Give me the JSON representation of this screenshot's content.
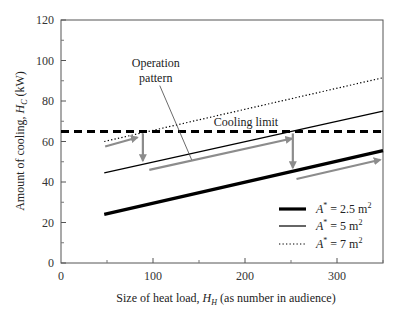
{
  "chart_data": {
    "type": "line",
    "title": "",
    "xlabel": "Size of heat load, H_H (as number in audience)",
    "xlabel_parts": {
      "prefix": "Size of heat load, ",
      "symbol": "H",
      "sub": "H",
      "suffix": " (as number in audience)"
    },
    "ylabel": "Amount of cooling, H_C (kW)",
    "ylabel_parts": {
      "prefix": "Amount of cooling, ",
      "symbol": "H",
      "sub": "C",
      "suffix": " (kW)"
    },
    "xlim": [
      0,
      350
    ],
    "ylim": [
      0,
      120
    ],
    "x_ticks": [
      0,
      100,
      200,
      300
    ],
    "x_minor_ticks": [
      50,
      150,
      250,
      350
    ],
    "y_ticks": [
      0,
      20,
      40,
      60,
      80,
      100,
      120
    ],
    "y_minor_ticks": [
      10,
      30,
      50,
      70,
      90,
      110
    ],
    "grid": false,
    "legend_position": "lower right",
    "series": [
      {
        "name": "A* = 2.5 m²",
        "label_parts": {
          "sym": "A",
          "sup": "*",
          "eq": " = 2.5 m",
          "unit_sup": "2"
        },
        "style": "thick-solid",
        "color": "#000000",
        "x": [
          47,
          350
        ],
        "values": [
          24,
          55.5
        ]
      },
      {
        "name": "A* = 5 m²",
        "label_parts": {
          "sym": "A",
          "sup": "*",
          "eq": " = 5 m",
          "unit_sup": "2"
        },
        "style": "thin-solid",
        "color": "#000000",
        "x": [
          47,
          350
        ],
        "values": [
          44.5,
          75
        ]
      },
      {
        "name": "A* = 7 m²",
        "label_parts": {
          "sym": "A",
          "sup": "*",
          "eq": " = 7 m",
          "unit_sup": "2"
        },
        "style": "dotted",
        "color": "#000000",
        "x": [
          47,
          350
        ],
        "values": [
          60,
          91.5
        ]
      }
    ],
    "reference_lines": [
      {
        "name": "Cooling limit",
        "label": "Cooling limit",
        "y": 65,
        "style": "dashed-thick",
        "color": "#000000"
      }
    ],
    "annotations": [
      {
        "text_lines": [
          "Operation",
          "pattern"
        ],
        "x": 103,
        "y": 97,
        "pointer_to": {
          "x": 142,
          "y": 51
        }
      }
    ],
    "operation_arrows": {
      "color": "#8c8c8c",
      "segments": [
        {
          "from": [
            48,
            57.5
          ],
          "to": [
            83,
            62
          ]
        },
        {
          "from": [
            89,
            64
          ],
          "to": [
            89,
            50.5
          ]
        },
        {
          "from": [
            96,
            46
          ],
          "to": [
            251,
            61.5
          ]
        },
        {
          "from": [
            252,
            64
          ],
          "to": [
            252,
            47
          ]
        },
        {
          "from": [
            256,
            41.5
          ],
          "to": [
            347,
            51
          ]
        }
      ]
    }
  }
}
